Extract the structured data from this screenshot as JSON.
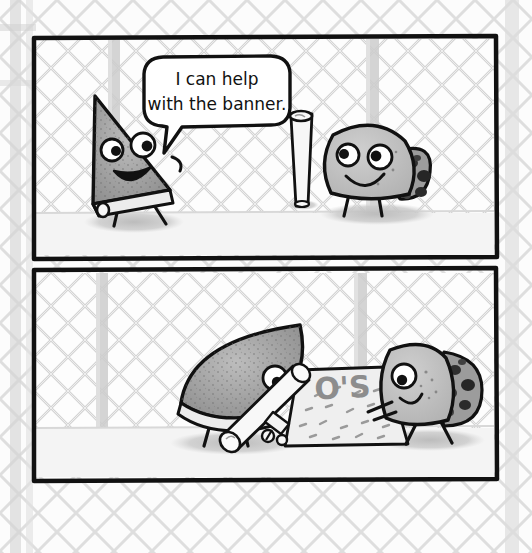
{
  "comic": {
    "title": "Pizza slice and cookie comic strip",
    "background": {
      "type": "chain-link-fence",
      "fence_color": "#c9c9c9",
      "fence_color_light": "#dcdcdc",
      "post_color": "#c4c4c4",
      "sky_color": "#fbfbfb"
    },
    "panel_border_color": "#111111",
    "panel_fill_color": "#fcfcfc",
    "ground_color": "#f2f2f2",
    "shadow_color": "#c8c8c8",
    "panels": [
      {
        "id": "panel-1",
        "index": 1,
        "x": 33,
        "y": 36,
        "width": 464,
        "height": 222,
        "speech_bubble": {
          "lines": [
            "I can help",
            "with the banner."
          ],
          "full_text": "I can help with the banner.",
          "x": 148,
          "y": 55,
          "width": 136,
          "height": 70
        },
        "characters": [
          {
            "name": "pizza-slice-character",
            "role": "speaker",
            "expression": "smiling-open-mouth",
            "body_color": "#a8a8a8",
            "crust_color": "#e8e8e8",
            "legs": 2
          },
          {
            "name": "cookie-character",
            "role": "listener",
            "expression": "smiling-closed-mouth",
            "body_color": "#bcbcbc",
            "chip_color": "#3a3a3a",
            "legs": 2
          }
        ],
        "props": [
          {
            "name": "rolled-banner-paper",
            "state": "rolled-upright",
            "color": "#f4f4f4"
          }
        ]
      },
      {
        "id": "panel-2",
        "index": 2,
        "x": 33,
        "y": 270,
        "width": 464,
        "height": 210,
        "speech_bubble": null,
        "characters": [
          {
            "name": "pizza-slice-character",
            "role": "painter",
            "expression": "concentrating",
            "body_color": "#a8a8a8",
            "crust_color": "#e8e8e8",
            "legs": 2
          },
          {
            "name": "cookie-character",
            "role": "holding-banner",
            "expression": "smiling-closed-mouth",
            "body_color": "#bcbcbc",
            "chip_color": "#3a3a3a",
            "legs": 2
          }
        ],
        "props": [
          {
            "name": "unrolled-banner",
            "state": "unrolled-flat",
            "color": "#eeeeee",
            "visible_text": "O'S",
            "decoration": "scattered-dashes"
          },
          {
            "name": "rolled-banner-paper",
            "state": "partially-rolled",
            "color": "#f4f4f4"
          }
        ]
      }
    ]
  }
}
